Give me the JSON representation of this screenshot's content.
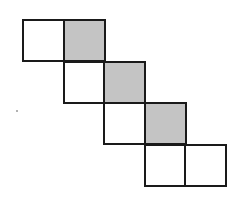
{
  "diagram": {
    "cell_size": 41,
    "origin": {
      "x": 22,
      "y": 19
    },
    "colors": {
      "fill_shaded": "#c4c4c4",
      "fill_plain": "#ffffff",
      "stroke": "#1a1a1a"
    },
    "cells": [
      {
        "row": 0,
        "col": 0,
        "shaded": false
      },
      {
        "row": 0,
        "col": 1,
        "shaded": true
      },
      {
        "row": 1,
        "col": 1,
        "shaded": false
      },
      {
        "row": 1,
        "col": 2,
        "shaded": true
      },
      {
        "row": 2,
        "col": 2,
        "shaded": false
      },
      {
        "row": 2,
        "col": 3,
        "shaded": true
      },
      {
        "row": 3,
        "col": 3,
        "shaded": false
      },
      {
        "row": 3,
        "col": 4,
        "shaded": false
      }
    ]
  }
}
